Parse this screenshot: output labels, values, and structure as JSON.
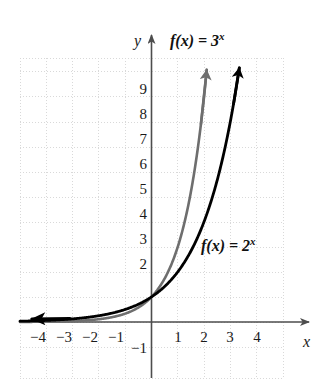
{
  "chart_data": {
    "type": "line",
    "title": "",
    "subtitle": "",
    "xlabel": "x",
    "ylabel": "y",
    "xlim": [
      -5,
      5.1
    ],
    "ylim": [
      -1.3,
      10.6
    ],
    "grid": true,
    "grid_style": "dotted",
    "grid_color": "#d8d8d8",
    "legend_position": "inline-annotations",
    "x_ticks": [
      -4,
      -3,
      -2,
      -1,
      1,
      2,
      3,
      4
    ],
    "x_tick_labels": [
      "−4",
      "−3",
      "−2",
      "−1",
      "1",
      "2",
      "3",
      "4"
    ],
    "y_ticks": [
      -1,
      2,
      3,
      4,
      5,
      6,
      7,
      8,
      9
    ],
    "y_tick_labels": [
      "−1",
      "2",
      "3",
      "4",
      "5",
      "6",
      "7",
      "8",
      "9"
    ],
    "series": [
      {
        "name": "f(x) = 3^x",
        "color": "#6e6e6e",
        "linewidth": 2.6,
        "arrow_end": "up",
        "x": [
          -4.8,
          -4.5,
          -4,
          -3.5,
          -3,
          -2.5,
          -2,
          -1.5,
          -1,
          -0.5,
          0,
          0.5,
          1,
          1.5,
          2,
          2.1
        ],
        "y": [
          0.008,
          0.012,
          0.012,
          0.021,
          0.037,
          0.064,
          0.111,
          0.192,
          0.333,
          0.577,
          1,
          1.732,
          3,
          5.196,
          9,
          10.05
        ]
      },
      {
        "name": "f(x) = 2^x",
        "color": "#000000",
        "linewidth": 2.8,
        "arrow_end": "up",
        "arrow_start": "left",
        "x": [
          -4.8,
          -4.5,
          -4,
          -3.5,
          -3,
          -2.5,
          -2,
          -1.5,
          -1,
          -0.5,
          0,
          0.5,
          1,
          1.5,
          2,
          2.5,
          3,
          3.32
        ],
        "y": [
          0.036,
          0.044,
          0.0625,
          0.088,
          0.125,
          0.177,
          0.25,
          0.354,
          0.5,
          0.707,
          1,
          1.414,
          2,
          2.828,
          4,
          5.657,
          8,
          10.0
        ]
      }
    ],
    "annotations": [
      {
        "text_prefix": "f(x) = 3",
        "text_exponent": "x",
        "target_series": "f(x) = 3^x"
      },
      {
        "text_prefix": "f(x) = 2",
        "text_exponent": "x",
        "target_series": "f(x) = 2^x"
      }
    ],
    "axis_color": "#4d4d4d"
  },
  "labels": {
    "y_axis_letter": "y",
    "x_axis_letter": "x",
    "curve_label_3x_prefix": "f(x) = 3",
    "curve_label_3x_exponent": "x",
    "curve_label_2x_prefix": "f(x) = 2",
    "curve_label_2x_exponent": "x",
    "y_ticks": {
      "t9": "9",
      "t8": "8",
      "t7": "7",
      "t6": "6",
      "t5": "5",
      "t4": "4",
      "t3": "3",
      "t2": "2",
      "tm1": "−1"
    },
    "x_ticks": {
      "tm4": "−4",
      "tm3": "−3",
      "tm2": "−2",
      "tm1": "−1",
      "t1": "1",
      "t2": "2",
      "t3": "3",
      "t4": "4"
    }
  }
}
